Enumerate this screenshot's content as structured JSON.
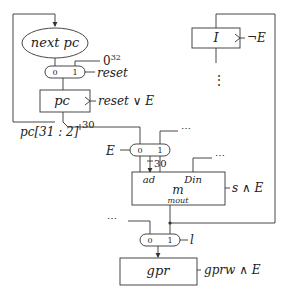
{
  "diagram": {
    "nodes": {
      "nextpc": {
        "label": "next pc"
      },
      "pc": {
        "label": "pc",
        "control": "reset ∨ E"
      },
      "mux_reset": {
        "in0": "0",
        "in1": "1",
        "select": "reset",
        "const_input": "0",
        "const_sup": "32"
      },
      "pc_slice": {
        "label": "pc[31 : 2]",
        "width": "30"
      },
      "mux_E": {
        "in0": "0",
        "in1": "1",
        "select": "E",
        "ellipsis": "⋯",
        "width": "30"
      },
      "instr_reg": {
        "label": "I",
        "control": "¬E",
        "ellipsis": "⋮"
      },
      "memory": {
        "label": "m",
        "port_ad": "ad",
        "port_din": "Din",
        "port_mout": "mout",
        "control": "s ∧ E",
        "din_ellipsis": "⋯"
      },
      "mux_l": {
        "in0": "0",
        "in1": "1",
        "select": "l",
        "ellipsis": "⋯"
      },
      "gpr": {
        "label": "gpr",
        "control": "gprw ∧ E"
      }
    }
  }
}
